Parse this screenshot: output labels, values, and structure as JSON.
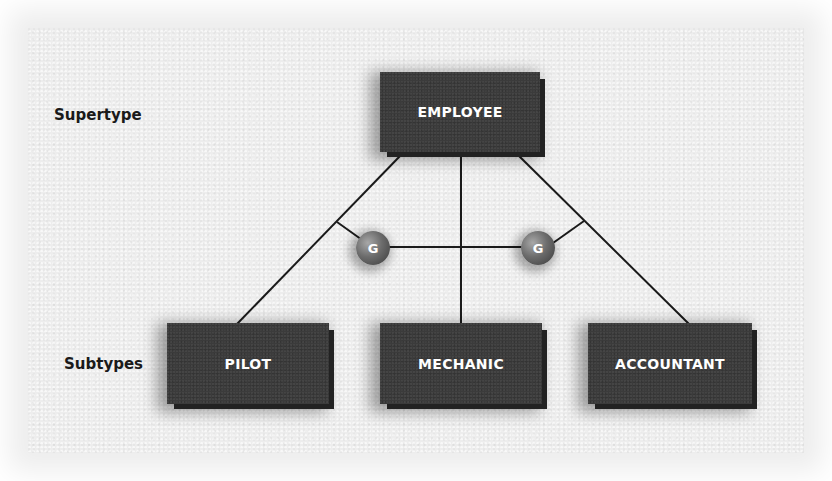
{
  "diagram": {
    "type": "supertype-subtype hierarchy",
    "labels": {
      "supertype": "Supertype",
      "subtypes": "Subtypes"
    },
    "supertype_entity": {
      "name": "EMPLOYEE"
    },
    "subtype_entities": [
      {
        "name": "PILOT"
      },
      {
        "name": "MECHANIC"
      },
      {
        "name": "ACCOUNTANT"
      }
    ],
    "generalization_nodes": [
      {
        "symbol": "G"
      },
      {
        "symbol": "G"
      }
    ],
    "colors": {
      "background": "#ededed",
      "entity_fill": "#3b3b3b",
      "entity_text": "#ffffff",
      "line": "#1a1a1a",
      "label_text": "#1a1a1a"
    }
  }
}
